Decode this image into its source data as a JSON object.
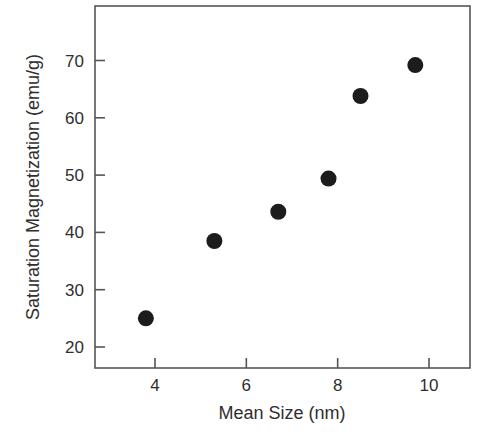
{
  "chart_data": {
    "type": "scatter",
    "title": "",
    "xlabel": "Mean Size (nm)",
    "ylabel": "Saturation Magnetization (emu/g)",
    "xlim": [
      2.7,
      11.0
    ],
    "ylim": [
      16.4,
      79.0
    ],
    "x_ticks": [
      4,
      6,
      8,
      10
    ],
    "y_ticks": [
      20,
      30,
      40,
      50,
      60,
      70
    ],
    "grid": false,
    "legend": null,
    "series": [
      {
        "name": "data",
        "marker": "filled-circle",
        "color": "#1c1c1c",
        "points": [
          {
            "x": 3.8,
            "y": 25.0
          },
          {
            "x": 5.3,
            "y": 38.5
          },
          {
            "x": 6.7,
            "y": 43.6
          },
          {
            "x": 7.8,
            "y": 49.4
          },
          {
            "x": 8.5,
            "y": 63.8
          },
          {
            "x": 9.7,
            "y": 69.2
          }
        ]
      }
    ]
  },
  "layout": {
    "plot": {
      "left": 95,
      "top": 6,
      "right": 470,
      "bottom": 368
    },
    "x_map": {
      "v0": 4,
      "px0": 155,
      "v1": 10,
      "px1": 429
    },
    "y_map": {
      "v0": 20,
      "px0": 347,
      "v1": 70,
      "px1": 60.5
    },
    "marker_radius": 8
  }
}
